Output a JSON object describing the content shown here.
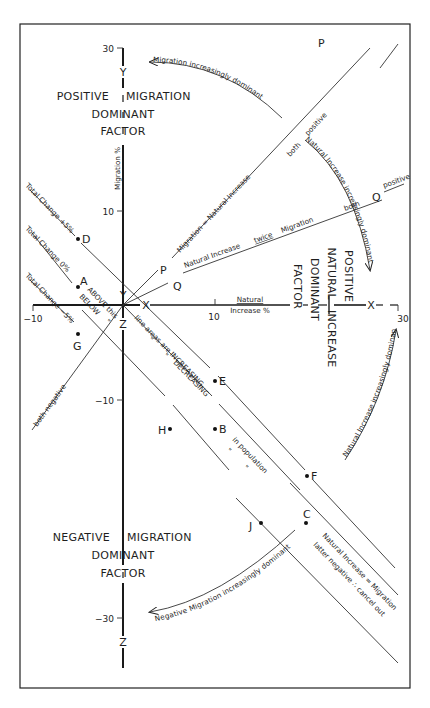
{
  "diagram": {
    "type": "migration-natural-increase-graph",
    "axes": {
      "x": {
        "label_line1": "Natural",
        "label_line2": "Increase %",
        "ticks": [
          {
            "value": -10,
            "label": "−10"
          },
          {
            "value": 10,
            "label": "10"
          },
          {
            "value": 30,
            "label": "30"
          }
        ],
        "range": [
          -10,
          30
        ],
        "letter_near_origin": "X",
        "letter_far": "X"
      },
      "y": {
        "label": "Migration %",
        "ticks": [
          {
            "value": 30,
            "label": "30"
          },
          {
            "value": 10,
            "label": "10"
          },
          {
            "value": -10,
            "label": "−10"
          },
          {
            "value": -30,
            "label": "−30"
          }
        ],
        "range": [
          -30,
          30
        ],
        "letter_top": "Y",
        "letter_near_origin_up": "Y",
        "letter_near_origin_down": "Z",
        "letter_bottom": "Z"
      }
    },
    "quadrant_titles": {
      "positive_migration": {
        "line1_left": "POSITIVE",
        "line1_right": "MIGRATION",
        "line2": "DOMINANT",
        "line3": "FACTOR"
      },
      "negative_migration": {
        "line1_left": "NEGATIVE",
        "line1_right": "MIGRATION",
        "line2": "DOMINANT",
        "line3": "FACTOR"
      },
      "positive_natural": {
        "line1": "POSITIVE",
        "line2_left": "NATURAL",
        "line2_right": "INCREASE",
        "line3": "DOMINANT",
        "line4": "FACTOR"
      }
    },
    "arcs": {
      "top": "Migration increasingly dominant",
      "right_upper": "Natural Increase increasingly dominant",
      "right_lower": "Natural Increase increasingly dominant",
      "bottom": "Negative Migration increasingly dominant"
    },
    "lines": {
      "migration_equals_natural": "Migration = Natural Increase",
      "both_positive_1": "both",
      "both_positive_2": "positive",
      "natural_twice_migration_a": "Natural Increase",
      "natural_twice_migration_b": "twice",
      "natural_twice_migration_c": "Migration",
      "both_q": "both",
      "positive_q": "positive",
      "both_negative": "both negative",
      "total_change_plus5": "Total Change +5%",
      "total_change_zero": "Total Change 0%",
      "total_change_minus5": "Total Change −5%",
      "above_this": "ABOVE this",
      "below": "BELOW",
      "ditto1": "\"",
      "line_areas_increasing": "line areas are INCREASING",
      "ditto_a": "\"",
      "ditto_b": "\"",
      "decreasing": "DECREASING",
      "in_population": "in population",
      "ditto_c": "\"",
      "ditto_d": "\"",
      "natural_equals_migration": "Natural Increase = Migration",
      "latter_negative": "latter negative ∴ cancel out"
    },
    "points": [
      {
        "id": "P1",
        "label": "P"
      },
      {
        "id": "P2",
        "label": "P"
      },
      {
        "id": "Q1",
        "label": "Q"
      },
      {
        "id": "Q2",
        "label": "Q"
      },
      {
        "id": "A",
        "label": "A"
      },
      {
        "id": "B",
        "label": "B"
      },
      {
        "id": "C",
        "label": "C"
      },
      {
        "id": "D",
        "label": "D"
      },
      {
        "id": "E",
        "label": "E"
      },
      {
        "id": "F",
        "label": "F"
      },
      {
        "id": "G",
        "label": "G"
      },
      {
        "id": "H",
        "label": "H"
      },
      {
        "id": "J",
        "label": "J"
      }
    ]
  }
}
